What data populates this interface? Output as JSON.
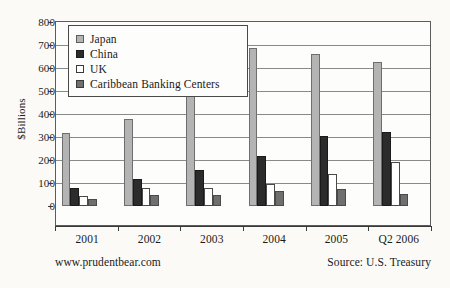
{
  "chart_data": {
    "type": "bar",
    "title": "",
    "subtitle": "",
    "xlabel": "",
    "ylabel": "$Billions",
    "ylim": [
      0,
      800
    ],
    "ytick_step": 100,
    "yticks": [
      "800",
      "700",
      "600",
      "500",
      "400",
      "300",
      "200",
      "100",
      "0"
    ],
    "grid": true,
    "legend_position": "top-left-inside",
    "categories": [
      "2001",
      "2002",
      "2003",
      "2004",
      "2005",
      "Q2 2006"
    ],
    "series": [
      {
        "name": "Japan",
        "color": "#b4b4b4",
        "values": [
          318,
          378,
          498,
          685,
          660,
          625
        ]
      },
      {
        "name": "China",
        "color": "#2c2c2c",
        "values": [
          78,
          118,
          155,
          218,
          303,
          320
        ]
      },
      {
        "name": "UK",
        "color": "#ffffff",
        "values": [
          45,
          80,
          78,
          95,
          140,
          193
        ]
      },
      {
        "name": "Caribbean Banking Centers",
        "color": "#6f6f6f",
        "values": [
          30,
          48,
          46,
          65,
          72,
          52
        ]
      }
    ]
  },
  "footer": {
    "left": "www.prudentbear.com",
    "right": "Source: U.S. Treasury"
  }
}
